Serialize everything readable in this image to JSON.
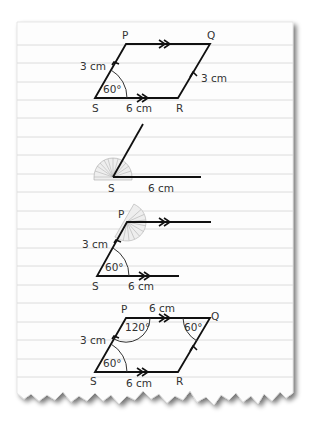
{
  "paper": {
    "background": "#fdfdfd",
    "line_color": "#dcdcdc",
    "ink": "#111111",
    "label_color": "#333333",
    "protractor_color": "#999999"
  },
  "diagrams": [
    {
      "id": "final-parallelogram-preview",
      "vertices": {
        "P": "P",
        "Q": "Q",
        "R": "R",
        "S": "S"
      },
      "labels": {
        "sp": "3 cm",
        "qr": "3 cm",
        "sr": "6 cm",
        "angle_s": "60°"
      }
    },
    {
      "id": "step1-base-and-angle",
      "vertices": {
        "S": "S"
      },
      "labels": {
        "base": "6 cm"
      }
    },
    {
      "id": "step2-parallel-lines",
      "vertices": {
        "P": "P",
        "S": "S"
      },
      "labels": {
        "sp": "3 cm",
        "sr": "6 cm",
        "angle_s": "60°"
      }
    },
    {
      "id": "step3-completed",
      "vertices": {
        "P": "P",
        "Q": "Q",
        "R": "R",
        "S": "S"
      },
      "labels": {
        "pq": "6 cm",
        "sp": "3 cm",
        "sr": "6 cm",
        "angle_p": "120°",
        "angle_q": "60°",
        "angle_s": "60°"
      }
    }
  ]
}
